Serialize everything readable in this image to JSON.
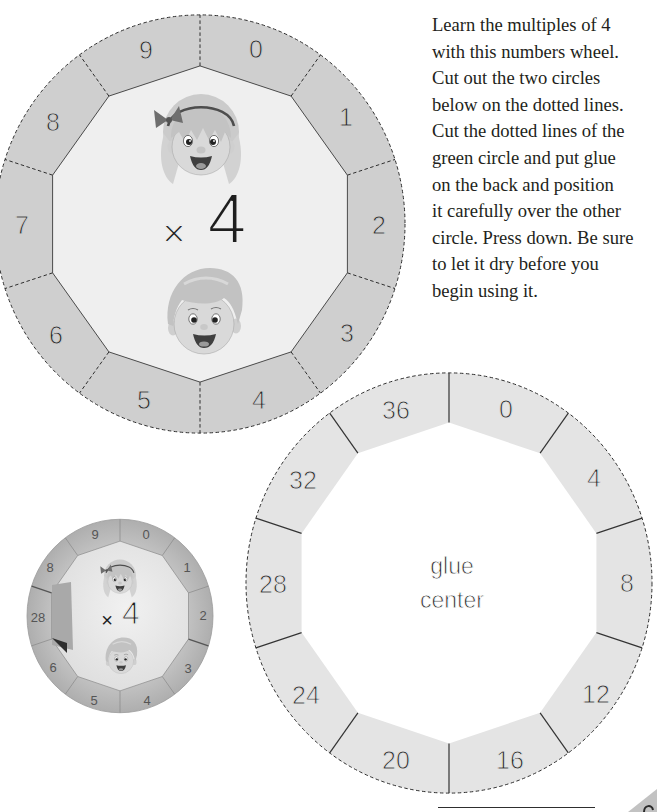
{
  "instructions": {
    "lines": [
      "Learn the multiples of 4",
      "with this numbers wheel.",
      "Cut out the two circles",
      "below on the dotted lines.",
      "Cut the dotted lines of the",
      "green circle and put glue",
      "on the back and position",
      "it carefully over the other",
      "circle. Press down. Be sure",
      "to let it dry before you",
      "begin using it."
    ]
  },
  "multiplier_wheel": {
    "operator": "×",
    "multiplier": "4",
    "labels": [
      "0",
      "1",
      "2",
      "3",
      "4",
      "5",
      "6",
      "7",
      "8",
      "9"
    ],
    "illustrations": [
      "girl-face",
      "boy-face"
    ]
  },
  "answer_wheel": {
    "labels": [
      "0",
      "4",
      "8",
      "12",
      "16",
      "20",
      "24",
      "28",
      "32",
      "36"
    ],
    "center_text": [
      "glue",
      "center"
    ]
  },
  "assembled_wheel_photo": {
    "operator": "×",
    "multiplier": "4",
    "labels": [
      "0",
      "1",
      "2",
      "3",
      "4",
      "5",
      "6",
      "28",
      "8",
      "9"
    ]
  },
  "colors": {
    "multiplier_ring": "#cfcfcf",
    "multiplier_inner": "#efefef",
    "answer_ring": "#e4e4e4",
    "text": "#231f20"
  }
}
